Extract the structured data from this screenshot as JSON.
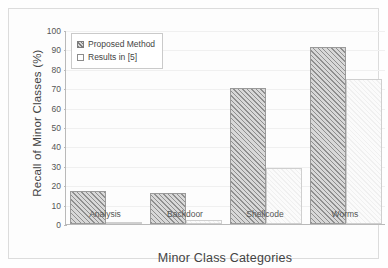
{
  "chart_data": {
    "type": "bar",
    "title": "",
    "subtitle": "",
    "xlabel": "Minor Class Categories",
    "ylabel": "Recall of Minor Classes (%)",
    "categories": [
      "Analysis",
      "Backdoor",
      "Shellcode",
      "Worms"
    ],
    "series": [
      {
        "name": "Proposed Method",
        "values": [
          17,
          16,
          70,
          91
        ],
        "style": "hatched-dark"
      },
      {
        "name": "Results in [5]",
        "values": [
          1,
          2,
          29,
          75
        ],
        "style": "open-light"
      }
    ],
    "ylim": [
      0,
      100
    ],
    "yticks": [
      0,
      10,
      20,
      30,
      40,
      50,
      60,
      70,
      80,
      90,
      100
    ],
    "ytick_labels": [
      "0",
      "10",
      "20",
      "30",
      "40",
      "50",
      "60",
      "70",
      "80",
      "90",
      "100"
    ],
    "grid": "horizontal",
    "legend_position": "top-left-inside",
    "colors": {
      "proposed_fill": "#d8d8d8",
      "proposed_hatch": "#8f8f8f",
      "results_fill": "#fbfbfb",
      "results_border": "#cfcfcf",
      "axis": "#b9b9b9",
      "gridline": "#f0f0f0",
      "text": "#434343",
      "frame": "#dcdcdc",
      "background": "#fdfdfd"
    }
  }
}
